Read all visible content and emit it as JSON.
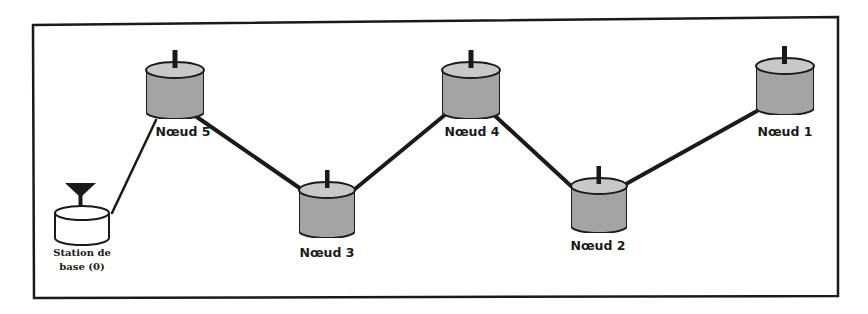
{
  "diagram": {
    "type": "network-topology",
    "colors": {
      "frame": "#1a1a1a",
      "node_fill": "#a6a6a6",
      "node_top": "#c8c8c8",
      "base_fill": "#ffffff",
      "link": "#1a1a1a"
    },
    "nodes": [
      {
        "id": "base",
        "label_line1": "Station de",
        "label_line2": "base (0)",
        "icon": "antenna-icon"
      },
      {
        "id": "n5",
        "label": "Nœud 5"
      },
      {
        "id": "n3",
        "label": "Nœud 3"
      },
      {
        "id": "n4",
        "label": "Nœud 4"
      },
      {
        "id": "n2",
        "label": "Nœud 2"
      },
      {
        "id": "n1",
        "label": "Nœud 1"
      }
    ],
    "links": [
      {
        "from": "base",
        "to": "n5"
      },
      {
        "from": "n5",
        "to": "n3"
      },
      {
        "from": "n3",
        "to": "n4"
      },
      {
        "from": "n4",
        "to": "n2"
      },
      {
        "from": "n2",
        "to": "n1"
      }
    ]
  }
}
